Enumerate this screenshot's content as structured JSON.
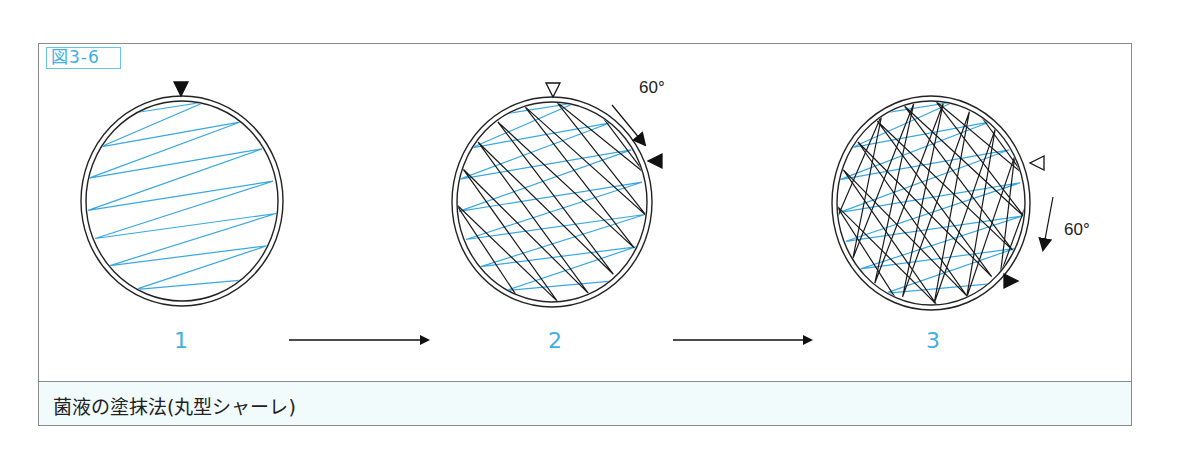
{
  "figure": {
    "label": "図3-6",
    "caption": "菌液の塗抹法(丸型シャーレ)"
  },
  "colors": {
    "accent": "#3fb0e0",
    "streak_blue": "#3aa8e0",
    "streak_black": "#1a1a1a",
    "caption_bg": "#f2fbfc",
    "frame": "#8a8a8a"
  },
  "steps": [
    {
      "number": "1",
      "center": [
        182,
        201
      ],
      "rx": 101,
      "ry": 105,
      "marker": {
        "type": "filled-triangle",
        "x": 181,
        "y": 89,
        "direction": "down"
      },
      "layers": [
        {
          "color": "blue",
          "rotation_deg": 0
        }
      ]
    },
    {
      "number": "2",
      "center": [
        552,
        202
      ],
      "rx": 100,
      "ry": 105,
      "marker": {
        "type": "hollow-triangle",
        "x": 553,
        "y": 90,
        "direction": "down"
      },
      "next_marker": {
        "type": "filled-triangle",
        "x": 655,
        "y": 161,
        "direction": "left"
      },
      "rotation_arrow": {
        "label": "60°",
        "from": [
          612,
          105
        ],
        "to": [
          645,
          145
        ],
        "label_pos": [
          639,
          78
        ]
      },
      "layers": [
        {
          "color": "blue",
          "rotation_deg": 0
        },
        {
          "color": "black",
          "rotation_deg": 60
        }
      ]
    },
    {
      "number": "3",
      "center": [
        931,
        203
      ],
      "rx": 99,
      "ry": 107,
      "marker": {
        "type": "hollow-triangle",
        "x": 1037,
        "y": 163,
        "direction": "left"
      },
      "next_marker": {
        "type": "filled-triangle",
        "x": 1011,
        "y": 281,
        "direction": "right"
      },
      "rotation_arrow": {
        "label": "60°",
        "from": [
          1053,
          197
        ],
        "to": [
          1043,
          250
        ],
        "label_pos": [
          1064,
          220
        ]
      },
      "layers": [
        {
          "color": "blue",
          "rotation_deg": 0
        },
        {
          "color": "black",
          "rotation_deg": 60
        },
        {
          "color": "black",
          "rotation_deg": 120
        }
      ]
    }
  ],
  "flow_arrows": [
    {
      "from": [
        289,
        340
      ],
      "to": [
        428,
        340
      ]
    },
    {
      "from": [
        673,
        340
      ],
      "to": [
        811,
        340
      ]
    }
  ],
  "step_label_positions": [
    [
      181,
      340
    ],
    [
      555,
      340
    ],
    [
      933,
      340
    ]
  ],
  "streak_zigzag_relative": [
    [
      -52,
      -84
    ],
    [
      23,
      -95
    ],
    [
      -81,
      -52
    ],
    [
      59,
      -76
    ],
    [
      -93,
      -22
    ],
    [
      80,
      -50
    ],
    [
      -94,
      9
    ],
    [
      91,
      -19
    ],
    [
      -87,
      36
    ],
    [
      94,
      12
    ],
    [
      -72,
      62
    ],
    [
      85,
      43
    ],
    [
      -47,
      85
    ],
    [
      60,
      76
    ]
  ]
}
